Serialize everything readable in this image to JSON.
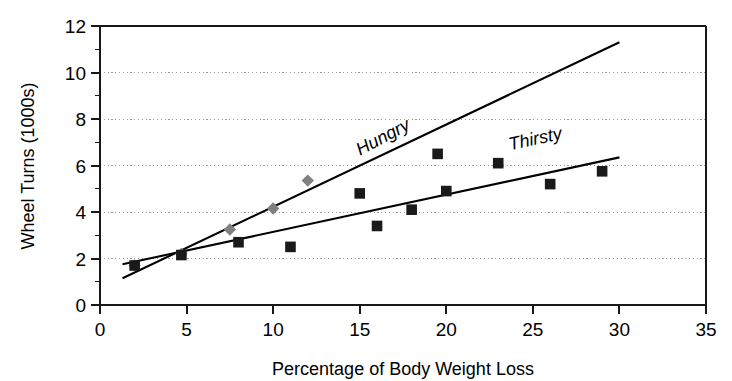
{
  "chart_data": {
    "type": "scatter",
    "title": "",
    "xlabel": "Percentage of Body Weight Loss",
    "ylabel": "Wheel Turns (1000s)",
    "xlim": [
      0,
      35
    ],
    "ylim": [
      0,
      12
    ],
    "xticks": [
      0,
      5,
      10,
      15,
      20,
      25,
      30,
      35
    ],
    "yticks": [
      0,
      2,
      4,
      6,
      8,
      10,
      12
    ],
    "xtick_labels": [
      "0",
      "5",
      "10",
      "15",
      "20",
      "25",
      "30",
      "35"
    ],
    "ytick_labels": [
      "0",
      "2",
      "4",
      "6",
      "8",
      "10",
      "12"
    ],
    "grid": true,
    "grid_axis": "y",
    "grid_style": "dotted",
    "legend": "inline-annotations",
    "legend_position": "on-plot",
    "series": [
      {
        "name": "Hungry",
        "marker": "diamond",
        "marker_color": "#808080",
        "trendline": true,
        "trendline_color": "#000000",
        "trendline_endpoints": [
          [
            1.3,
            1.15
          ],
          [
            30.0,
            11.3
          ]
        ],
        "points": [
          {
            "x": 2.0,
            "y": 1.7
          },
          {
            "x": 4.7,
            "y": 2.2
          },
          {
            "x": 7.5,
            "y": 3.25
          },
          {
            "x": 10.0,
            "y": 4.15
          },
          {
            "x": 12.0,
            "y": 5.35
          }
        ],
        "annotation": {
          "label": "Hungry",
          "x": 16.5,
          "y": 7.0,
          "rotation": -28
        }
      },
      {
        "name": "Thirsty",
        "marker": "square",
        "marker_color": "#1a1a1a",
        "trendline": true,
        "trendline_color": "#000000",
        "trendline_endpoints": [
          [
            1.3,
            1.75
          ],
          [
            30.0,
            6.35
          ]
        ],
        "points": [
          {
            "x": 2.0,
            "y": 1.7
          },
          {
            "x": 4.7,
            "y": 2.15
          },
          {
            "x": 8.0,
            "y": 2.7
          },
          {
            "x": 11.0,
            "y": 2.5
          },
          {
            "x": 15.0,
            "y": 4.8
          },
          {
            "x": 16.0,
            "y": 3.4
          },
          {
            "x": 18.0,
            "y": 4.1
          },
          {
            "x": 19.5,
            "y": 6.5
          },
          {
            "x": 20.0,
            "y": 4.9
          },
          {
            "x": 23.0,
            "y": 6.1
          },
          {
            "x": 26.0,
            "y": 5.2
          },
          {
            "x": 29.0,
            "y": 5.75
          }
        ],
        "annotation": {
          "label": "Thirsty",
          "x": 25.2,
          "y": 6.9,
          "rotation": -12
        }
      }
    ]
  },
  "axes": {
    "y_axis_label": "Wheel Turns (1000s)",
    "x_axis_label": "Percentage of Body Weight Loss"
  },
  "annotations": {
    "hungry_label": "Hungry",
    "thirsty_label": "Thirsty"
  }
}
